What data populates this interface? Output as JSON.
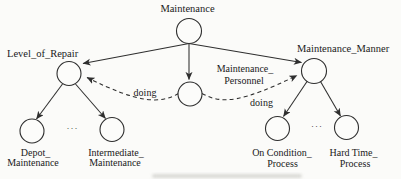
{
  "colors": {
    "line": "#2e2e2e",
    "text": "#1a1a1a",
    "background": "#fbfbf9",
    "nodefill": "#fcfcfa"
  },
  "diagram": {
    "root": {
      "label": "Maintenance"
    },
    "left_branch": {
      "label": "Level_of_Repair",
      "ellipsis": "···",
      "children": [
        {
          "line1": "Depot_",
          "line2": "Maintenance"
        },
        {
          "line1": "Intermediate_",
          "line2": "Maintenance"
        }
      ]
    },
    "middle": {
      "line1": "Maintenance_",
      "line2": "Personnel"
    },
    "right_branch": {
      "label": "Maintenance_Manner",
      "ellipsis": "···",
      "children": [
        {
          "line1": "On Condition_",
          "line2": "Process"
        },
        {
          "line1": "Hard Time_",
          "line2": "Process"
        }
      ]
    },
    "edge_labels": {
      "left": "doing",
      "right": "doing"
    }
  }
}
